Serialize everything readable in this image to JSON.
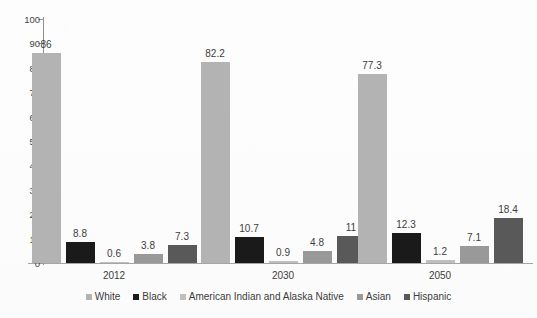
{
  "chart_data": {
    "type": "bar",
    "title": "",
    "xlabel": "",
    "ylabel": "",
    "ylim": [
      0,
      100
    ],
    "yticks": [
      0,
      10,
      20,
      30,
      40,
      50,
      60,
      70,
      80,
      90,
      100
    ],
    "grid": false,
    "legend_position": "bottom",
    "categories": [
      "2012",
      "2030",
      "2050"
    ],
    "series": [
      {
        "name": "White",
        "color": "#b3b3b3",
        "values": [
          86,
          82.2,
          77.3
        ],
        "labels": [
          "86",
          "82.2",
          "77.3"
        ]
      },
      {
        "name": "Black",
        "color": "#1a1a1a",
        "values": [
          8.8,
          10.7,
          12.3
        ],
        "labels": [
          "8.8",
          "10.7",
          "12.3"
        ]
      },
      {
        "name": "American Indian and Alaska Native",
        "color": "#bfbfbf",
        "values": [
          0.6,
          0.9,
          1.2
        ],
        "labels": [
          "0.6",
          "0.9",
          "1.2"
        ]
      },
      {
        "name": "Asian",
        "color": "#999999",
        "values": [
          3.8,
          4.8,
          7.1
        ],
        "labels": [
          "3.8",
          "4.8",
          "7.1"
        ]
      },
      {
        "name": "Hispanic",
        "color": "#595959",
        "values": [
          7.3,
          11,
          18.4
        ],
        "labels": [
          "7.3",
          "11",
          "18.4"
        ]
      }
    ]
  },
  "axis": {
    "y_tick_labels": [
      "100",
      "90",
      "80",
      "70",
      "60",
      "50",
      "40",
      "30",
      "20",
      "10",
      "0"
    ]
  },
  "legend": {
    "items": [
      {
        "label": "White",
        "color": "#b3b3b3"
      },
      {
        "label": "Black",
        "color": "#1a1a1a"
      },
      {
        "label": "American Indian and Alaska Native",
        "color": "#bfbfbf"
      },
      {
        "label": "Asian",
        "color": "#999999"
      },
      {
        "label": "Hispanic",
        "color": "#595959"
      }
    ]
  }
}
